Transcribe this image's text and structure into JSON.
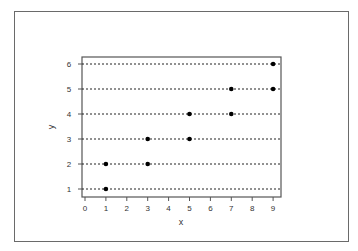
{
  "chart_data": {
    "type": "scatter",
    "title": "",
    "xlabel": "x",
    "ylabel": "y",
    "xlim": [
      0,
      9
    ],
    "ylim": [
      1,
      6
    ],
    "xticks": [
      "0",
      "1",
      "2",
      "3",
      "4",
      "5",
      "6",
      "7",
      "8",
      "9"
    ],
    "yticks": [
      "1",
      "2",
      "3",
      "4",
      "5",
      "6"
    ],
    "grid": "horizontal dotted lines at each y tick",
    "legend": null,
    "points": [
      {
        "x": 1,
        "y": 1
      },
      {
        "x": 1,
        "y": 2
      },
      {
        "x": 3,
        "y": 2
      },
      {
        "x": 3,
        "y": 3
      },
      {
        "x": 5,
        "y": 3
      },
      {
        "x": 5,
        "y": 4
      },
      {
        "x": 7,
        "y": 4
      },
      {
        "x": 7,
        "y": 5
      },
      {
        "x": 9,
        "y": 5
      },
      {
        "x": 9,
        "y": 6
      }
    ],
    "colors": {
      "points": "#000000",
      "grid": "#222222",
      "axis": "#555555"
    }
  }
}
